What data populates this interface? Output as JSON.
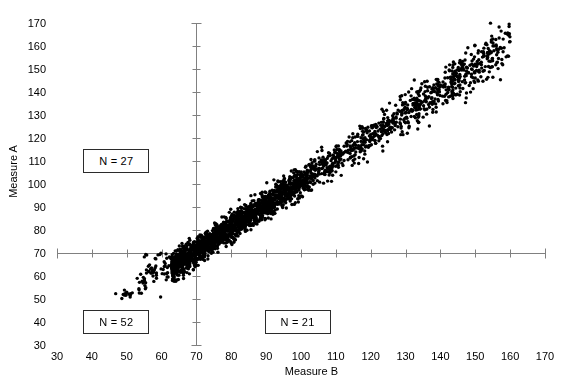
{
  "chart_data": {
    "type": "scatter",
    "title": "",
    "subtitle": "",
    "xlabel": "Measure B",
    "ylabel": "Measure A",
    "xlim": [
      30,
      170
    ],
    "ylim": [
      30,
      170
    ],
    "xticks": [
      30,
      40,
      50,
      60,
      70,
      80,
      90,
      100,
      110,
      120,
      130,
      140,
      150,
      160,
      170
    ],
    "yticks": [
      30,
      40,
      50,
      60,
      70,
      80,
      90,
      100,
      110,
      120,
      130,
      140,
      150,
      160,
      170
    ],
    "xtick_labels": [
      "30",
      "40",
      "50",
      "60",
      "70",
      "80",
      "90",
      "100",
      "110",
      "120",
      "130",
      "140",
      "150",
      "160",
      "170"
    ],
    "ytick_labels": [
      "30",
      "40",
      "50",
      "60",
      "70",
      "80",
      "90",
      "100",
      "110",
      "120",
      "130",
      "140",
      "150",
      "160",
      "170"
    ],
    "grid": false,
    "legend": false,
    "marker": {
      "shape": "circle",
      "color": "#000000",
      "size_px": 3.4
    },
    "reference_lines": [
      {
        "name": "vertical-cutoff",
        "orientation": "vertical",
        "value": 70,
        "color": "#808080",
        "from": 30,
        "to": 170
      },
      {
        "name": "horizontal-cutoff",
        "orientation": "horizontal",
        "value": 70,
        "color": "#808080",
        "from": 30,
        "to": 170
      }
    ],
    "quadrant_annotations": [
      {
        "name": "upper-left",
        "label": "N = 27",
        "count": 27,
        "x_center": 47,
        "y_center": 110
      },
      {
        "name": "lower-left",
        "label": "N = 52",
        "count": 52,
        "x_center": 47,
        "y_center": 40
      },
      {
        "name": "lower-right",
        "label": "N = 21",
        "count": 21,
        "x_center": 99,
        "y_center": 40
      }
    ],
    "series": [
      {
        "name": "observations",
        "n_points": 2100,
        "color": "#000000",
        "description": "Dense positively-correlated band running from about (65,65) to (160,163), plus a low-left satellite cluster near (50,52) and sparse points between x=52 and x=70.",
        "correlation_approx": 0.97,
        "regression_slope_approx": 1.0,
        "regression_intercept_approx": 0.0,
        "x_range_observed": [
          48,
          159
        ],
        "y_range_observed": [
          50,
          163
        ],
        "clusters": [
          {
            "name": "main-band",
            "x_start": 63,
            "x_end": 160,
            "weight": 0.9,
            "band_sd": 3.6
          },
          {
            "name": "low-left-satellite",
            "x_center": 50,
            "y_center": 52,
            "spread": 1.2,
            "count": 12
          },
          {
            "name": "left-tail",
            "x_start": 53,
            "x_end": 68,
            "count": 70,
            "band_sd": 3.2
          }
        ],
        "notable_outliers": [
          {
            "x": 158,
            "y": 163
          },
          {
            "x": 151,
            "y": 154
          },
          {
            "x": 146,
            "y": 152
          },
          {
            "x": 144,
            "y": 147
          },
          {
            "x": 49,
            "y": 52
          },
          {
            "x": 50,
            "y": 53
          }
        ]
      }
    ]
  }
}
